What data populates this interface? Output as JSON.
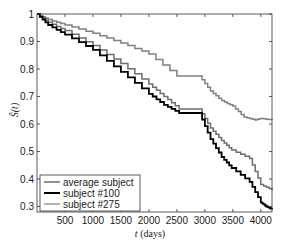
{
  "chart_data": {
    "type": "line",
    "title": "",
    "xlabel": "t (days)",
    "xlabel_italic_part": "t",
    "xlabel_unit": "(days)",
    "ylabel": "Ŝ(t)",
    "xlim": [
      0,
      4200
    ],
    "ylim": [
      0.28,
      1.0
    ],
    "xticks": [
      500,
      1000,
      1500,
      2000,
      2500,
      3000,
      3500,
      4000
    ],
    "xtick_labels": [
      "500",
      "1000",
      "1500",
      "2000",
      "2500",
      "3000",
      "3500",
      "4000"
    ],
    "yticks": [
      0.3,
      0.4,
      0.5,
      0.6,
      0.7,
      0.8,
      0.9,
      1.0
    ],
    "ytick_labels": [
      "0.3",
      "0.4",
      "0.5",
      "0.6",
      "0.7",
      "0.8",
      "0.9",
      "1"
    ],
    "grid": false,
    "legend_position": "lower left",
    "step": true,
    "series": [
      {
        "name": "average subject",
        "color": "#6e6e6e",
        "linewidth": 1.5,
        "x": [
          0,
          200,
          500,
          1000,
          1500,
          2000,
          2270,
          2540,
          2900,
          3100,
          3300,
          3480,
          3800,
          4000,
          4200
        ],
        "y": [
          1.0,
          0.97,
          0.94,
          0.885,
          0.82,
          0.745,
          0.7,
          0.655,
          0.655,
          0.585,
          0.54,
          0.505,
          0.475,
          0.38,
          0.36
        ]
      },
      {
        "name": "subject #100",
        "color": "#000000",
        "linewidth": 1.8,
        "x": [
          0,
          200,
          500,
          1000,
          1500,
          2000,
          2270,
          2540,
          2900,
          3100,
          3300,
          3480,
          3800,
          4000,
          4100,
          4200
        ],
        "y": [
          1.0,
          0.96,
          0.925,
          0.87,
          0.79,
          0.71,
          0.67,
          0.64,
          0.64,
          0.545,
          0.48,
          0.44,
          0.39,
          0.315,
          0.3,
          0.29
        ]
      },
      {
        "name": "subject #275",
        "color": "#808080",
        "linewidth": 1.5,
        "x": [
          0,
          200,
          500,
          1000,
          1500,
          2000,
          2500,
          2900,
          3100,
          3300,
          3500,
          3700,
          3900,
          4000,
          4200
        ],
        "y": [
          1.0,
          0.98,
          0.96,
          0.93,
          0.895,
          0.855,
          0.775,
          0.775,
          0.72,
          0.685,
          0.665,
          0.625,
          0.615,
          0.62,
          0.615
        ]
      }
    ]
  },
  "legend": {
    "items": [
      {
        "label": "average subject",
        "color": "#6e6e6e"
      },
      {
        "label": "subject #100",
        "color": "#000000"
      },
      {
        "label": "subject #275",
        "color": "#9a9a9a"
      }
    ]
  }
}
